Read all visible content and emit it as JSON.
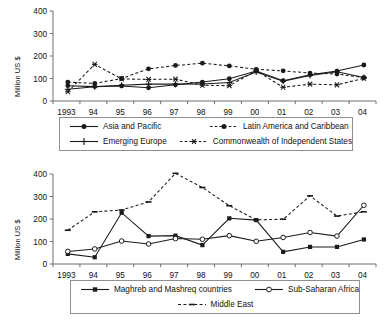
{
  "figure": {
    "width": 392,
    "height": 325,
    "background": "#ffffff",
    "axis_color": "#6f6f6f",
    "series_color": "#1a1a1a"
  },
  "chart_data": [
    {
      "id": "top",
      "type": "line",
      "title": "",
      "xlabel": "",
      "ylabel": "Million US $",
      "x": [
        "1993",
        "94",
        "95",
        "96",
        "97",
        "98",
        "99",
        "00",
        "01",
        "02",
        "03",
        "04"
      ],
      "xtick_labels": [
        "1993",
        "94",
        "95",
        "96",
        "97",
        "98",
        "99",
        "00",
        "01",
        "02",
        "03",
        "04"
      ],
      "ytick_labels": [
        "0",
        "100",
        "200",
        "300",
        "400"
      ],
      "yticks": [
        0,
        100,
        200,
        300,
        400
      ],
      "ylim": [
        0,
        400
      ],
      "grid": false,
      "legend_position": "below",
      "series": [
        {
          "name": "Asia and Pacific",
          "marker": "filled-circle",
          "linestyle": "solid",
          "values": [
            68,
            64,
            67,
            59,
            72,
            84,
            99,
            133,
            90,
            117,
            133,
            160
          ]
        },
        {
          "name": "Latin America and Caribbean",
          "marker": "filled-circle",
          "linestyle": "dashed",
          "values": [
            84,
            78,
            100,
            143,
            158,
            168,
            156,
            141,
            134,
            124,
            120,
            104
          ]
        },
        {
          "name": "Emerging Europe",
          "marker": "plus",
          "linestyle": "solid",
          "values": [
            52,
            63,
            70,
            75,
            75,
            76,
            82,
            129,
            88,
            113,
            130,
            104
          ]
        },
        {
          "name": "Commonwealth of Independent States",
          "marker": "star",
          "linestyle": "dashed",
          "values": [
            41,
            163,
            98,
            96,
            97,
            70,
            68,
            135,
            61,
            75,
            72,
            101
          ]
        }
      ]
    },
    {
      "id": "bottom",
      "type": "line",
      "title": "",
      "xlabel": "",
      "ylabel": "Million US $",
      "x": [
        "1993",
        "94",
        "95",
        "96",
        "97",
        "98",
        "99",
        "00",
        "01",
        "02",
        "03",
        "04"
      ],
      "xtick_labels": [
        "1993",
        "94",
        "95",
        "96",
        "97",
        "98",
        "99",
        "00",
        "01",
        "02",
        "03",
        "04"
      ],
      "ytick_labels": [
        "0",
        "100",
        "200",
        "300",
        "400"
      ],
      "yticks": [
        0,
        100,
        200,
        300,
        400
      ],
      "ylim": [
        0,
        400
      ],
      "grid": false,
      "legend_position": "below",
      "series": [
        {
          "name": "Maghreb and Mashreq countries",
          "marker": "filled-square",
          "linestyle": "solid",
          "values": [
            45,
            30,
            228,
            124,
            126,
            84,
            203,
            195,
            54,
            76,
            76,
            109
          ]
        },
        {
          "name": "Sub-Saharan Africa",
          "marker": "open-circle",
          "linestyle": "solid",
          "values": [
            56,
            67,
            102,
            89,
            113,
            110,
            126,
            101,
            118,
            140,
            124,
            261
          ]
        },
        {
          "name": "Middle East",
          "marker": "dash",
          "linestyle": "dashed",
          "values": [
            150,
            232,
            240,
            276,
            403,
            340,
            259,
            196,
            199,
            303,
            213,
            232
          ]
        }
      ]
    }
  ]
}
